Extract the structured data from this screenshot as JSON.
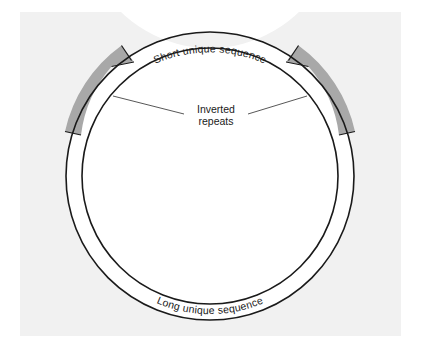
{
  "figure": {
    "width": 424,
    "height": 351,
    "background_color": "#ffffff",
    "panel_color": "#f1f1f1"
  },
  "diagram": {
    "type": "circular-genome-map",
    "center": {
      "x": 210,
      "y": 176
    },
    "outer_radius": 144,
    "inner_radius": 128,
    "ring_stroke_color": "#1a1a1a",
    "ring_fill_color": "#ffffff",
    "repeat_fill_color": "#a8a8a8",
    "leader_line_color": "#444444"
  },
  "labels": {
    "short_unique_sequence": "Short unique sequence",
    "long_unique_sequence": "Long unique sequence",
    "inverted_repeats_line1": "Inverted",
    "inverted_repeats_line2": "repeats"
  },
  "segments": [
    {
      "name": "short-unique-sequence",
      "fill": "#ffffff",
      "start_angle_deg": -76,
      "end_angle_deg": -104,
      "label": "Short unique sequence"
    },
    {
      "name": "inverted-repeat-left",
      "fill": "#a8a8a8",
      "start_angle_deg": -108,
      "end_angle_deg": -162,
      "arrow_direction": "clockwise"
    },
    {
      "name": "inverted-repeat-right",
      "fill": "#a8a8a8",
      "start_angle_deg": -72,
      "end_angle_deg": -18,
      "arrow_direction": "counterclockwise"
    },
    {
      "name": "long-unique-sequence",
      "fill": "#ffffff",
      "start_angle_deg": -18,
      "end_angle_deg": 198,
      "label": "Long unique sequence"
    }
  ]
}
